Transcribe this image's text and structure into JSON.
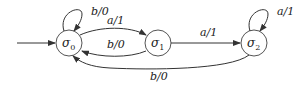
{
  "diagram": {
    "type": "finite-state-machine",
    "states": [
      {
        "id": "s0",
        "label": "σ",
        "subscript": "0",
        "initial": true
      },
      {
        "id": "s1",
        "label": "σ",
        "subscript": "1"
      },
      {
        "id": "s2",
        "label": "σ",
        "subscript": "2"
      }
    ],
    "transitions": [
      {
        "from": "s0",
        "to": "s0",
        "label": "b/0"
      },
      {
        "from": "s0",
        "to": "s1",
        "label": "a/1"
      },
      {
        "from": "s1",
        "to": "s0",
        "label": "b/0"
      },
      {
        "from": "s1",
        "to": "s2",
        "label": "a/1"
      },
      {
        "from": "s2",
        "to": "s2",
        "label": "a/1"
      },
      {
        "from": "s2",
        "to": "s0",
        "label": "b/0"
      }
    ]
  }
}
